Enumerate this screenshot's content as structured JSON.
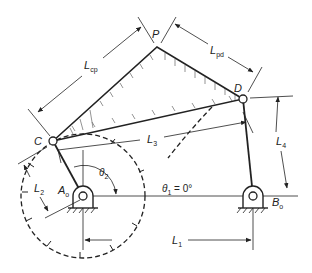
{
  "points": {
    "P": {
      "label": "P",
      "x": 157,
      "y": 47
    },
    "D": {
      "label": "D",
      "x": 243,
      "y": 99
    },
    "C": {
      "label": "C",
      "x": 53,
      "y": 141
    },
    "A0": {
      "label": "A",
      "sub": "o",
      "x": 83,
      "y": 196
    },
    "B0": {
      "label": "B",
      "sub": "o",
      "x": 253,
      "y": 196
    }
  },
  "dimensions": {
    "Lcp": {
      "main": "L",
      "sub": "cp"
    },
    "Lpd": {
      "main": "L",
      "sub": "pd"
    },
    "L1": {
      "main": "L",
      "sub": "1"
    },
    "L2": {
      "main": "L",
      "sub": "2"
    },
    "L3": {
      "main": "L",
      "sub": "3"
    },
    "L4": {
      "main": "L",
      "sub": "4"
    }
  },
  "angles": {
    "theta1": {
      "main": "θ",
      "sub": "1",
      "rest": " = 0°"
    },
    "theta2": {
      "main": "θ",
      "sub": "2"
    }
  },
  "colors": {
    "line": "#222222",
    "hatch": "#555555",
    "background": "#ffffff"
  }
}
